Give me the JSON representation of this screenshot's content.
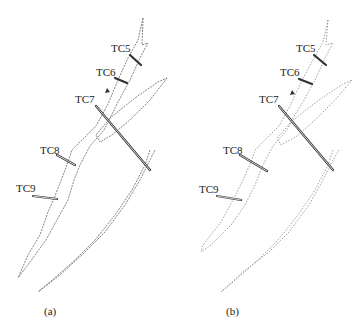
{
  "figure": {
    "panels": [
      {
        "caption": "(a)",
        "labels": {
          "tc5": "TC5",
          "tc6": "TC6",
          "tc7": "TC7",
          "tc8": "TC8",
          "tc9": "TC9"
        }
      },
      {
        "caption": "(b)",
        "labels": {
          "tc5": "TC5",
          "tc6": "TC6",
          "tc7": "TC7",
          "tc8": "TC8",
          "tc9": "TC9"
        }
      }
    ],
    "colors": {
      "line": "#555555",
      "bar": "#333333",
      "background": "#ffffff"
    }
  }
}
